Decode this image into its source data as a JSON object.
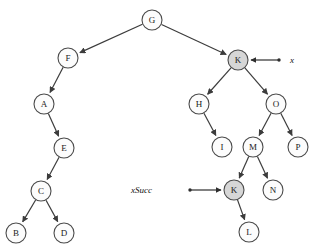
{
  "figure": {
    "background_color": "#ffffff",
    "node_fill_default": "#fcfcfc",
    "node_fill_highlight": "#d6d6d6",
    "node_stroke": "#4a4a4a",
    "edge_color": "#3c3c3c",
    "node_radius": 10
  },
  "nodes": [
    {
      "id": "G",
      "label": "G",
      "cx": 152,
      "cy": 20,
      "highlight": false
    },
    {
      "id": "F",
      "label": "F",
      "cx": 68,
      "cy": 58,
      "highlight": false
    },
    {
      "id": "K1",
      "label": "K",
      "cx": 238,
      "cy": 60,
      "highlight": true
    },
    {
      "id": "A",
      "label": "A",
      "cx": 44,
      "cy": 104,
      "highlight": false
    },
    {
      "id": "H",
      "label": "H",
      "cx": 199,
      "cy": 104,
      "highlight": false
    },
    {
      "id": "O",
      "label": "O",
      "cx": 276,
      "cy": 104,
      "highlight": false
    },
    {
      "id": "E",
      "label": "E",
      "cx": 64,
      "cy": 148,
      "highlight": false
    },
    {
      "id": "I",
      "label": "I",
      "cx": 222,
      "cy": 147,
      "highlight": false
    },
    {
      "id": "M",
      "label": "M",
      "cx": 253,
      "cy": 147,
      "highlight": false
    },
    {
      "id": "P",
      "label": "P",
      "cx": 298,
      "cy": 147,
      "highlight": false
    },
    {
      "id": "C",
      "label": "C",
      "cx": 41,
      "cy": 191,
      "highlight": false
    },
    {
      "id": "K2",
      "label": "K",
      "cx": 234,
      "cy": 190,
      "highlight": true
    },
    {
      "id": "N",
      "label": "N",
      "cx": 273,
      "cy": 190,
      "highlight": false
    },
    {
      "id": "B",
      "label": "B",
      "cx": 16,
      "cy": 233,
      "highlight": false
    },
    {
      "id": "D",
      "label": "D",
      "cx": 64,
      "cy": 233,
      "highlight": false
    },
    {
      "id": "L",
      "label": "L",
      "cx": 249,
      "cy": 232,
      "highlight": false
    }
  ],
  "edges": [
    {
      "from": "G",
      "to": "F"
    },
    {
      "from": "G",
      "to": "K1"
    },
    {
      "from": "F",
      "to": "A"
    },
    {
      "from": "A",
      "to": "E"
    },
    {
      "from": "E",
      "to": "C"
    },
    {
      "from": "C",
      "to": "B"
    },
    {
      "from": "C",
      "to": "D"
    },
    {
      "from": "K1",
      "to": "H"
    },
    {
      "from": "K1",
      "to": "O"
    },
    {
      "from": "H",
      "to": "I"
    },
    {
      "from": "O",
      "to": "M"
    },
    {
      "from": "O",
      "to": "P"
    },
    {
      "from": "M",
      "to": "K2"
    },
    {
      "from": "M",
      "to": "N"
    },
    {
      "from": "K2",
      "to": "L"
    }
  ],
  "pointers": [
    {
      "id": "x-pointer",
      "label": "x",
      "label_x": 290,
      "label_y": 60,
      "dot_x": 279,
      "dot_y": 60,
      "tip_x": 251,
      "tip_y": 60,
      "direction": "left",
      "target": "K1"
    },
    {
      "id": "xsucc-pointer",
      "label": "xSucc",
      "label_x": 152,
      "label_y": 190,
      "dot_x": 190,
      "dot_y": 190,
      "tip_x": 221,
      "tip_y": 190,
      "direction": "right",
      "target": "K2"
    }
  ]
}
